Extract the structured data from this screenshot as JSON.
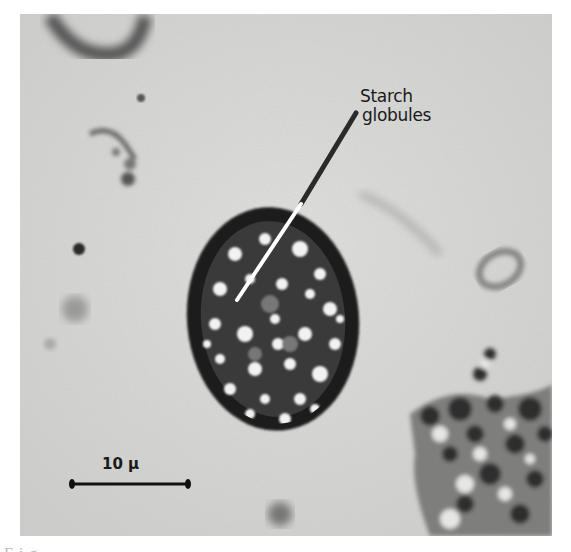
{
  "figure": {
    "type": "micrograph",
    "annotation": {
      "line1": "Starch",
      "line2": "globules"
    },
    "scale_bar": {
      "label": "10 μ",
      "length_px": 118
    },
    "caption_partial": "Fig. ..."
  },
  "colors": {
    "background": "#d6d6d4",
    "cyst_wall": "#1c1c1c",
    "leader_line_outside": "#2a2a2a",
    "leader_line_inside": "#ffffff",
    "text": "#1a1a1a"
  }
}
